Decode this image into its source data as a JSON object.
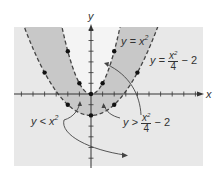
{
  "chart_data": {
    "type": "line",
    "title": "",
    "xlabel": "x",
    "ylabel": "y",
    "xlim": [
      -6.5,
      9.7
    ],
    "ylim": [
      -6.7,
      6.3
    ],
    "grid": false,
    "series": [
      {
        "name": "y = x^2",
        "style": "dashed",
        "points": [
          [
            -2,
            4
          ],
          [
            -1,
            1
          ],
          [
            0,
            0
          ],
          [
            1,
            1
          ],
          [
            2,
            4
          ]
        ]
      },
      {
        "name": "y = x^2/4 - 2",
        "style": "dashed",
        "points": [
          [
            -4,
            2
          ],
          [
            -2,
            -1
          ],
          [
            0,
            -2
          ],
          [
            2,
            -1
          ],
          [
            4,
            2
          ]
        ]
      }
    ],
    "shaded_region": "y < x^2 and y > x^2/4 - 2",
    "annotations": [
      {
        "text": "y = x²",
        "target": "upper curve"
      },
      {
        "text": "y = x²/4 − 2",
        "target": "lower curve"
      },
      {
        "text": "y < x²",
        "target": "region below y = x²"
      },
      {
        "text": "y > x²/4 − 2",
        "target": "region above y = x²/4 − 2"
      }
    ]
  },
  "labels": {
    "x_axis": "x",
    "y_axis": "y",
    "curve1": "y = x",
    "curve1_exp": "2",
    "curve2_lhs": "y =",
    "curve2_num": "x",
    "curve2_num_exp": "2",
    "curve2_den": "4",
    "curve2_rhs": "− 2",
    "ineq1": "y < x",
    "ineq1_exp": "2",
    "ineq2_lhs": "y >",
    "ineq2_num": "x",
    "ineq2_num_exp": "2",
    "ineq2_den": "4",
    "ineq2_rhs": "− 2"
  },
  "colors": {
    "background": "#e8e8e8",
    "shaded": "#c8c8c8",
    "inner_light": "#f4f4f4",
    "curve": "#444444",
    "axis": "#333333",
    "point": "#111111"
  }
}
